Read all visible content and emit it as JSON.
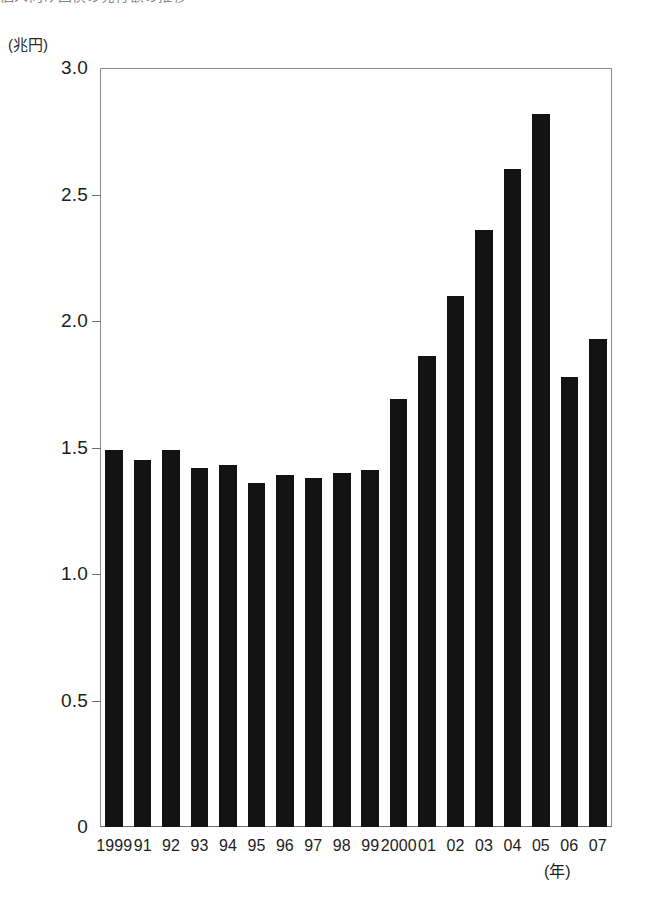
{
  "chart_data": {
    "type": "bar",
    "title": "",
    "title_cropped_text": "個人向け国債の発行額の推移",
    "xlabel": "(年)",
    "ylabel": "(兆円)",
    "ylim": [
      0,
      3.0
    ],
    "ytick_labels": [
      "0",
      "0.5",
      "1.0",
      "1.5",
      "2.0",
      "2.5",
      "3.0"
    ],
    "ytick_values": [
      0,
      0.5,
      1.0,
      1.5,
      2.0,
      2.5,
      3.0
    ],
    "grid": false,
    "legend": "none",
    "bar_color": "#131313",
    "frame_color": "#8b8b90",
    "categories": [
      "1999",
      "91",
      "92",
      "93",
      "94",
      "95",
      "96",
      "97",
      "98",
      "99",
      "2000",
      "01",
      "02",
      "03",
      "04",
      "05",
      "06",
      "07"
    ],
    "values": [
      1.49,
      1.45,
      1.49,
      1.42,
      1.43,
      1.36,
      1.39,
      1.38,
      1.4,
      1.41,
      1.69,
      1.86,
      2.1,
      2.36,
      2.6,
      2.82,
      1.78,
      1.93
    ]
  }
}
